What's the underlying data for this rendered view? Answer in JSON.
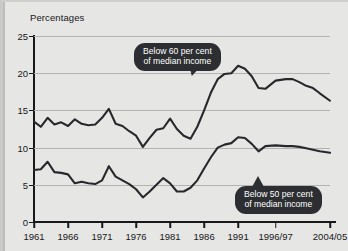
{
  "chart_data": {
    "type": "line",
    "title": "Percentages",
    "xlabel": "",
    "ylabel": "Percentages",
    "ylim": [
      0,
      25
    ],
    "yticks": [
      0,
      5,
      10,
      15,
      20,
      25
    ],
    "grid": true,
    "legend_position": "inline-callouts",
    "xlim": [
      1961,
      2004.5
    ],
    "xtick_labels": [
      "1961",
      "1966",
      "1971",
      "1976",
      "1981",
      "1986",
      "1991",
      "1996/97",
      "2004/05"
    ],
    "xtick_values": [
      1961,
      1966,
      1971,
      1976,
      1981,
      1986,
      1991,
      1996.5,
      2004.5
    ],
    "annotations": [
      {
        "name": "below-60-callout",
        "text_line1": "Below 60 per cent",
        "text_line2": "of median income",
        "series": "Below 60 per cent of median income"
      },
      {
        "name": "below-50-callout",
        "text_line1": "Below 50 per cent",
        "text_line2": "of median income",
        "series": "Below 50 per cent of median income"
      }
    ],
    "series": [
      {
        "name": "Below 60 per cent of median income",
        "color": "#26282b",
        "x": [
          1961,
          1962,
          1963,
          1964,
          1965,
          1966,
          1967,
          1968,
          1969,
          1970,
          1971,
          1972,
          1973,
          1974,
          1975,
          1976,
          1977,
          1978,
          1979,
          1980,
          1981,
          1982,
          1983,
          1984,
          1985,
          1986,
          1987,
          1988,
          1989,
          1990,
          1991,
          1992,
          1993,
          1994,
          1995,
          1996.5,
          1998,
          1999,
          2000,
          2001,
          2002,
          2003,
          2004.5
        ],
        "values": [
          13.5,
          12.8,
          14.0,
          13.1,
          13.4,
          12.9,
          13.8,
          13.2,
          13.0,
          13.1,
          14.0,
          15.2,
          13.2,
          12.9,
          12.2,
          11.6,
          10.1,
          11.3,
          12.4,
          12.6,
          13.9,
          12.5,
          11.6,
          11.2,
          12.8,
          15.0,
          17.4,
          19.2,
          19.9,
          20.0,
          21.0,
          20.6,
          19.6,
          18.0,
          17.9,
          19.0,
          19.2,
          19.2,
          18.8,
          18.3,
          18.0,
          17.3,
          16.3
        ]
      },
      {
        "name": "Below 50 per cent of median income",
        "color": "#26282b",
        "x": [
          1961,
          1962,
          1963,
          1964,
          1965,
          1966,
          1967,
          1968,
          1969,
          1970,
          1971,
          1972,
          1973,
          1974,
          1975,
          1976,
          1977,
          1978,
          1979,
          1980,
          1981,
          1982,
          1983,
          1984,
          1985,
          1986,
          1987,
          1988,
          1989,
          1990,
          1991,
          1992,
          1993,
          1994,
          1995,
          1996.5,
          1998,
          1999,
          2000,
          2001,
          2002,
          2003,
          2004.5
        ],
        "values": [
          7.0,
          7.1,
          8.1,
          6.7,
          6.6,
          6.4,
          5.2,
          5.4,
          5.2,
          5.1,
          5.6,
          7.5,
          6.1,
          5.6,
          5.1,
          4.4,
          3.3,
          4.1,
          5.0,
          5.9,
          5.2,
          4.1,
          4.1,
          4.6,
          5.6,
          7.2,
          8.7,
          10.0,
          10.4,
          10.6,
          11.4,
          11.3,
          10.5,
          9.5,
          10.2,
          10.3,
          10.2,
          10.2,
          10.1,
          9.9,
          9.7,
          9.5,
          9.3
        ]
      }
    ]
  }
}
